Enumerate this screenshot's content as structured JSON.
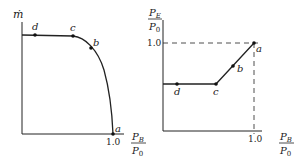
{
  "left_plot": {
    "y_label": "ṁ",
    "x_label_num": "P",
    "x_label_num_sub": "B",
    "x_label_den": "P",
    "x_label_den_sub": "0",
    "x_tick": "1.0",
    "points": {
      "a": "a",
      "b": "b",
      "c": "c",
      "d": "d"
    }
  },
  "right_plot": {
    "y_label_num": "P",
    "y_label_num_sub": "E",
    "y_label_den": "P",
    "y_label_den_sub": "0",
    "y_tick": "1.0",
    "x_label_num": "P",
    "x_label_num_sub": "B",
    "x_label_den": "P",
    "x_label_den_sub": "0",
    "x_tick": "1.0",
    "points": {
      "a": "a",
      "b": "b",
      "c": "c",
      "d": "d"
    }
  },
  "colors": {
    "ink": "#222222",
    "background": "#ffffff"
  }
}
